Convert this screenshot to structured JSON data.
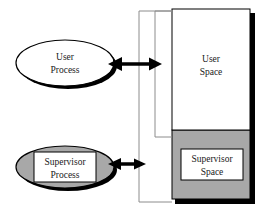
{
  "diagram": {
    "background_color": "#ffffff",
    "nodes": {
      "user_process": {
        "label_line1": "User",
        "label_line2": "Process",
        "shape": "ellipse",
        "fill": "#ffffff",
        "stroke": "#000000",
        "has_shadow": true
      },
      "supervisor_process": {
        "label_line1": "Supervisor",
        "label_line2": "Process",
        "shape": "ellipse",
        "fill": "#a8a8a8",
        "stroke": "#000000",
        "has_shadow": true,
        "inner_box_fill": "#ffffff"
      },
      "user_space": {
        "label_line1": "User",
        "label_line2": "Space",
        "shape": "rectangle",
        "fill": "#ffffff",
        "stroke": "#000000"
      },
      "supervisor_space": {
        "label_line1": "Supervisor",
        "label_line2": "Space",
        "shape": "rectangle",
        "region_fill": "#a8a8a8",
        "inner_box_fill": "#ffffff",
        "stroke": "#000000"
      }
    },
    "connectors": {
      "user_arrow": {
        "name": "user-process-to-user-space",
        "style": "double-headed",
        "color": "#000000"
      },
      "supervisor_arrow": {
        "name": "supervisor-process-to-supervisor-space",
        "style": "double-headed",
        "color": "#000000"
      },
      "outer_bracket": {
        "name": "outer-scope-bracket",
        "color": "#8c8c8c"
      },
      "inner_bracket": {
        "name": "inner-scope-bracket",
        "color": "#8c8c8c"
      }
    },
    "colors": {
      "gray_fill": "#a8a8a8",
      "shadow": "#000000",
      "bracket_line": "#8c8c8c",
      "text": "#1a1a1a"
    }
  }
}
